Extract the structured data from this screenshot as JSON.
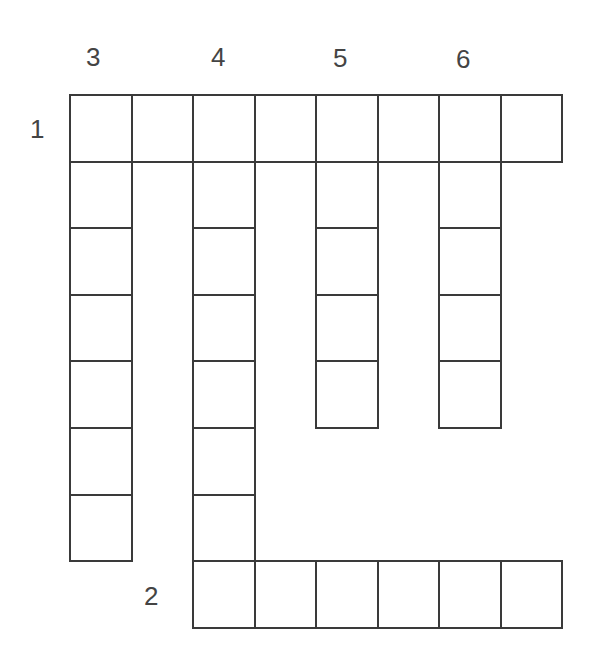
{
  "puzzle": {
    "type": "crossword",
    "clue_numbers": {
      "n1": "1",
      "n2": "2",
      "n3": "3",
      "n4": "4",
      "n5": "5",
      "n6": "6"
    },
    "words": [
      {
        "number": "1",
        "direction": "across",
        "length": 8,
        "start_row": 0,
        "start_col": 0
      },
      {
        "number": "2",
        "direction": "across",
        "length": 6,
        "start_row": 7,
        "start_col": 2
      },
      {
        "number": "3",
        "direction": "down",
        "length": 7,
        "start_row": 0,
        "start_col": 0
      },
      {
        "number": "4",
        "direction": "down",
        "length": 8,
        "start_row": 0,
        "start_col": 2
      },
      {
        "number": "5",
        "direction": "down",
        "length": 5,
        "start_row": 0,
        "start_col": 4
      },
      {
        "number": "6",
        "direction": "down",
        "length": 5,
        "start_row": 0,
        "start_col": 6
      }
    ],
    "cell_color": "#ffffff",
    "border_color": "#3a3a3a"
  }
}
